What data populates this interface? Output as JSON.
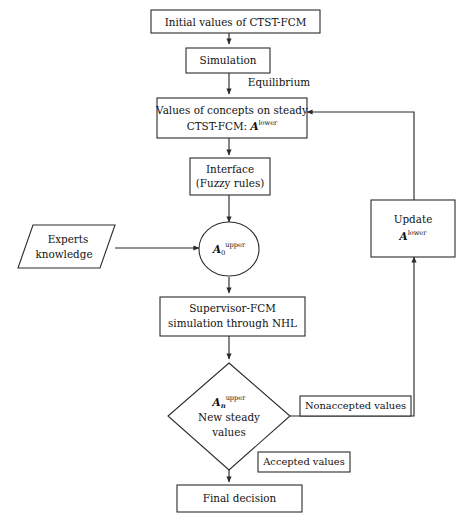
{
  "diagram": {
    "stroke_color": "#2b2b2b",
    "fill_color": "#ffffff",
    "text_color": "#111111",
    "nodes": {
      "initial_values": {
        "label": "Initial values of CTST-FCM",
        "shape": "rectangle"
      },
      "simulation": {
        "label": "Simulation",
        "shape": "rectangle"
      },
      "steady_values_line1": {
        "label": "Values of concepts on steady",
        "shape": "rectangle"
      },
      "steady_values_line2_prefix": {
        "label": "CTST-FCM: "
      },
      "steady_values_line2_symbol": {
        "label": "A"
      },
      "steady_values_line2_sup": {
        "label": "lower"
      },
      "interface_line1": {
        "label": "Interface",
        "shape": "rectangle"
      },
      "interface_line2": {
        "label": "(Fuzzy rules)"
      },
      "experts_knowledge_line1": {
        "label": "Experts",
        "shape": "parallelogram"
      },
      "experts_knowledge_line2": {
        "label": "knowledge"
      },
      "a0_upper_symbol": {
        "label": "A",
        "shape": "ellipse"
      },
      "a0_upper_sub": {
        "label": "0"
      },
      "a0_upper_sup": {
        "label": "upper"
      },
      "supervisor_line1": {
        "label": "Supervisor-FCM",
        "shape": "rectangle"
      },
      "supervisor_line2": {
        "label": "simulation through NHL"
      },
      "decision_symbol": {
        "label": "A",
        "shape": "diamond"
      },
      "decision_sub": {
        "label": "n"
      },
      "decision_sup": {
        "label": "upper"
      },
      "decision_line2": {
        "label": "New steady"
      },
      "decision_line3": {
        "label": "values"
      },
      "update_line1": {
        "label": "Update",
        "shape": "rectangle"
      },
      "update_line2_symbol": {
        "label": "A"
      },
      "update_line2_sup": {
        "label": "lower"
      },
      "nonaccepted_values": {
        "label": "Nonaccepted values",
        "shape": "rectangle"
      },
      "accepted_values": {
        "label": "Accepted values",
        "shape": "rectangle"
      },
      "final_decision": {
        "label": "Final decision",
        "shape": "rectangle"
      }
    },
    "edge_labels": {
      "equilibrium": "Equilibrium"
    }
  }
}
